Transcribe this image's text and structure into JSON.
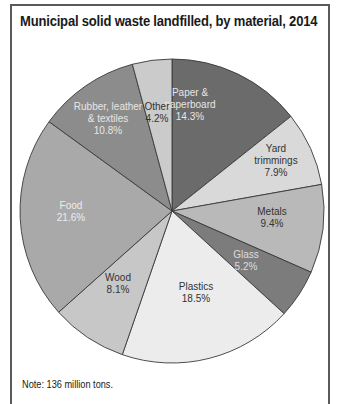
{
  "chart_data": {
    "type": "pie",
    "title": "Municipal solid waste landfilled, by material, 2014",
    "note": "Note: 136 million tons.",
    "unit": "%",
    "start_angle_deg": 0,
    "direction": "clockwise",
    "slices": [
      {
        "label": [
          "Paper &",
          "paperboard"
        ],
        "name": "Paper & paperboard",
        "value": 14.3,
        "value_label": "14.3%",
        "color": "#6b6b6b",
        "text_color": "#e6e6e6",
        "label_pos": [
          190,
          105
        ]
      },
      {
        "label": [
          "Yard",
          "trimmings"
        ],
        "name": "Yard trimmings",
        "value": 7.9,
        "value_label": "7.9%",
        "color": "#d9d9d9",
        "text_color": "#333333",
        "label_pos": [
          276,
          161
        ]
      },
      {
        "label": [
          "Metals"
        ],
        "name": "Metals",
        "value": 9.4,
        "value_label": "9.4%",
        "color": "#b9b9b9",
        "text_color": "#333333",
        "label_pos": [
          272,
          218
        ]
      },
      {
        "label": [
          "Glass"
        ],
        "name": "Glass",
        "value": 5.2,
        "value_label": "5.2%",
        "color": "#7c7c7c",
        "text_color": "#dddddd",
        "label_pos": [
          246,
          261
        ]
      },
      {
        "label": [
          "Plastics"
        ],
        "name": "Plastics",
        "value": 18.5,
        "value_label": "18.5%",
        "color": "#ececec",
        "text_color": "#333333",
        "label_pos": [
          196,
          293
        ]
      },
      {
        "label": [
          "Wood"
        ],
        "name": "Wood",
        "value": 8.1,
        "value_label": "8.1%",
        "color": "#c7c7c7",
        "text_color": "#333333",
        "label_pos": [
          118,
          284
        ]
      },
      {
        "label": [
          "Food"
        ],
        "name": "Food",
        "value": 21.6,
        "value_label": "21.6%",
        "color": "#a9a9a9",
        "text_color": "#ececec",
        "label_pos": [
          71,
          212
        ]
      },
      {
        "label": [
          "Rubber, leather",
          "& textiles"
        ],
        "name": "Rubber, leather & textiles",
        "value": 10.8,
        "value_label": "10.8%",
        "color": "#8c8c8c",
        "text_color": "#e6e6e6",
        "label_pos": [
          108,
          119
        ]
      },
      {
        "label": [
          "Other"
        ],
        "name": "Other",
        "value": 4.2,
        "value_label": "4.2%",
        "color": "#cbcbcb",
        "text_color": "#333333",
        "label_pos": [
          157,
          113
        ]
      }
    ],
    "center": [
      172,
      211
    ],
    "radius": 152
  }
}
